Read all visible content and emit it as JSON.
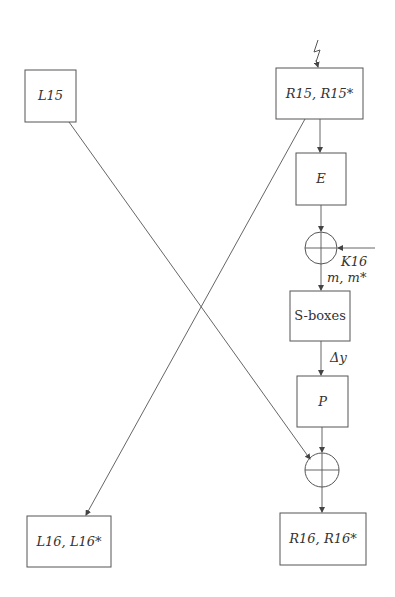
{
  "diagram": {
    "type": "DES round 16 fault injection data-flow",
    "nodes": {
      "l15": {
        "label": "L15"
      },
      "r15": {
        "label": "R15, R15*"
      },
      "e": {
        "label": "E"
      },
      "sboxes": {
        "label": "S-boxes"
      },
      "p": {
        "label": "P"
      },
      "l16": {
        "label": "L16, L16*"
      },
      "r16": {
        "label": "R16, R16*"
      }
    },
    "annotations": {
      "key": "K16",
      "sbox_input": "m, m*",
      "sbox_output_diff": "Δy",
      "fault_symbol": "lightning-bolt"
    },
    "edges": [
      {
        "from": "fault",
        "to": "r15"
      },
      {
        "from": "r15",
        "to": "e"
      },
      {
        "from": "e",
        "to": "xor1"
      },
      {
        "from": "k16",
        "to": "xor1"
      },
      {
        "from": "xor1",
        "to": "sboxes"
      },
      {
        "from": "sboxes",
        "to": "p"
      },
      {
        "from": "p",
        "to": "xor2"
      },
      {
        "from": "l15",
        "to": "xor2"
      },
      {
        "from": "xor2",
        "to": "r16"
      },
      {
        "from": "r15",
        "to": "l16"
      }
    ]
  }
}
